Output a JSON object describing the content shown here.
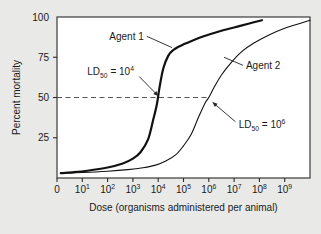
{
  "figure": {
    "background_color": "#e9e9e7",
    "plot_background_color": "#ffffff",
    "frame_color": "#3a3a3a"
  },
  "chart_data": {
    "type": "line",
    "title": "",
    "xlabel": "Dose (organisms administered per animal)",
    "ylabel": "Percent mortality",
    "xscale": "log",
    "xlim": [
      0,
      10
    ],
    "ylim": [
      0,
      100
    ],
    "grid": false,
    "legend": "none",
    "xticks": [
      {
        "label": "0",
        "exp": null,
        "base": "0",
        "value": 0
      },
      {
        "label": "10^1",
        "exp": "1",
        "base": "10",
        "value": 1
      },
      {
        "label": "10^2",
        "exp": "2",
        "base": "10",
        "value": 2
      },
      {
        "label": "10^3",
        "exp": "3",
        "base": "10",
        "value": 3
      },
      {
        "label": "10^4",
        "exp": "4",
        "base": "10",
        "value": 4
      },
      {
        "label": "10^5",
        "exp": "5",
        "base": "10",
        "value": 5
      },
      {
        "label": "10^6",
        "exp": "6",
        "base": "10",
        "value": 6
      },
      {
        "label": "10^7",
        "exp": "7",
        "base": "10",
        "value": 7
      },
      {
        "label": "10^8",
        "exp": "8",
        "base": "10",
        "value": 8
      },
      {
        "label": "10^9",
        "exp": "9",
        "base": "10",
        "value": 9
      }
    ],
    "yticks": [
      {
        "label": "25",
        "value": 25
      },
      {
        "label": "50",
        "value": 50
      },
      {
        "label": "75",
        "value": 75
      },
      {
        "label": "100",
        "value": 100
      }
    ],
    "series": [
      {
        "name": "Agent 1",
        "label": "Agent 1",
        "linewidth": "thick",
        "color": "#111111",
        "ld50_exponent": 4,
        "x": [
          0.15,
          0.6,
          1.2,
          2.0,
          2.6,
          3.0,
          3.3,
          3.6,
          3.8,
          3.95,
          4.05,
          4.2,
          4.4,
          4.6,
          4.8,
          5.0,
          5.3,
          5.8,
          6.4,
          7.0,
          7.6,
          8.1
        ],
        "y": [
          3,
          3.5,
          4.5,
          6.5,
          9,
          12,
          16,
          24,
          36,
          46,
          56,
          68,
          76,
          79.5,
          81.5,
          83,
          85,
          88,
          91,
          93.5,
          96,
          98
        ]
      },
      {
        "name": "Agent 2",
        "label": "Agent 2",
        "linewidth": "thin",
        "color": "#111111",
        "ld50_exponent": 6,
        "x": [
          0.15,
          1.0,
          2.0,
          2.8,
          3.4,
          3.9,
          4.3,
          4.7,
          5.0,
          5.3,
          5.6,
          5.85,
          6.0,
          6.2,
          6.5,
          6.9,
          7.3,
          7.8,
          8.4,
          9.0,
          9.6,
          10.0
        ],
        "y": [
          3,
          3.4,
          4.2,
          5.2,
          6.4,
          8.0,
          10.5,
          14.5,
          20,
          27,
          38,
          46.5,
          50,
          56,
          64,
          72,
          78.5,
          84,
          89,
          93,
          96,
          98
        ]
      }
    ],
    "annotations": [
      {
        "id": "ld50-agent1",
        "text": "LD50 = 10^4",
        "prefix": "LD",
        "sub": "50",
        "middle": " = 10",
        "sup": "4",
        "arrow_from": [
          3.2,
          66
        ],
        "arrow_to": [
          4.0,
          51
        ]
      },
      {
        "id": "ld50-agent2",
        "text": "LD50 = 10^6",
        "prefix": "LD",
        "sub": "50",
        "middle": " = 10",
        "sup": "6",
        "arrow_from": [
          7.1,
          33
        ],
        "arrow_to": [
          6.15,
          47
        ]
      },
      {
        "id": "agent1-leader",
        "text": "Agent 1",
        "arrow_from": [
          3.55,
          88
        ],
        "arrow_to": [
          4.55,
          81
        ]
      },
      {
        "id": "agent2-leader",
        "text": "Agent 2",
        "arrow_from": [
          7.35,
          70
        ],
        "arrow_to": [
          6.6,
          75
        ]
      }
    ],
    "reference_line": {
      "id": "ld50-reference",
      "orientation": "horizontal",
      "value": 50,
      "style": "dashed",
      "color": "#555555",
      "x_start": 0,
      "x_end": 6.0
    }
  }
}
